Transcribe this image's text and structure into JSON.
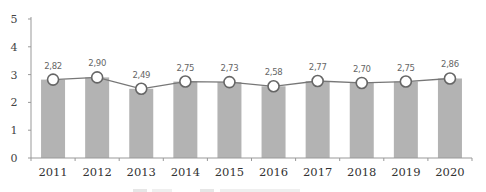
{
  "chart_data": {
    "type": "bar",
    "combo": "bar+line",
    "title": "",
    "xlabel": "",
    "ylabel": "",
    "categories": [
      "2011",
      "2012",
      "2013",
      "2014",
      "2015",
      "2016",
      "2017",
      "2018",
      "2019",
      "2020"
    ],
    "series": [
      {
        "name": "bar",
        "type": "bar",
        "color": "#b3b3b3",
        "values": [
          2.82,
          2.9,
          2.49,
          2.75,
          2.73,
          2.58,
          2.77,
          2.7,
          2.75,
          2.86
        ]
      },
      {
        "name": "line",
        "type": "line",
        "color": "#777777",
        "marker": "open-circle",
        "values": [
          2.82,
          2.9,
          2.49,
          2.75,
          2.73,
          2.58,
          2.77,
          2.7,
          2.75,
          2.86
        ]
      }
    ],
    "data_labels": [
      "2,82",
      "2,90",
      "2,49",
      "2,75",
      "2,73",
      "2,58",
      "2,77",
      "2,70",
      "2,75",
      "2,86"
    ],
    "yticks": [
      "0",
      "1",
      "2",
      "3",
      "4",
      "5"
    ],
    "ylim": [
      0,
      5
    ],
    "grid": false,
    "legend": {
      "position": "bottom",
      "visible": "cut off"
    }
  }
}
